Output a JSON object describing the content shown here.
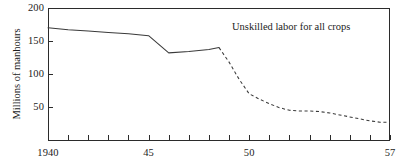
{
  "chart_data": {
    "type": "line",
    "title": "",
    "annotation": "Unskilled labor for all crops",
    "xlabel": "",
    "ylabel": "Millions of manhours",
    "xlim": [
      1940,
      1957
    ],
    "ylim": [
      0,
      200
    ],
    "grid": false,
    "legend_position": "none",
    "x_tick_labels": [
      "1940",
      "45",
      "50",
      "57"
    ],
    "x_tick_label_values": [
      1940,
      1945,
      1950,
      1957
    ],
    "x_tick_values": [
      1940,
      1941,
      1942,
      1943,
      1944,
      1945,
      1946,
      1947,
      1948,
      1949,
      1950,
      1951,
      1952,
      1953,
      1954,
      1955,
      1956,
      1957
    ],
    "y_tick_labels": [
      "200",
      "150",
      "100",
      "50"
    ],
    "y_tick_values": [
      200,
      150,
      100,
      50
    ],
    "series": [
      {
        "name": "Unskilled labor for all crops (observed)",
        "style": "solid",
        "x": [
          1940,
          1941,
          1942,
          1943,
          1944,
          1945,
          1946,
          1947,
          1948,
          1948.5
        ],
        "values": [
          170,
          167,
          165,
          163,
          161,
          158,
          132,
          134,
          137,
          140
        ]
      },
      {
        "name": "Unskilled labor for all crops (projected)",
        "style": "dashed",
        "x": [
          1948.5,
          1949,
          1949.5,
          1950,
          1950.5,
          1951,
          1951.5,
          1952,
          1952.5,
          1953,
          1953.5,
          1954,
          1954.5,
          1955,
          1955.5,
          1956,
          1956.5,
          1957
        ],
        "values": [
          140,
          118,
          92,
          70,
          62,
          55,
          49,
          45,
          44,
          44,
          43,
          41,
          38,
          35,
          32,
          29,
          27,
          27
        ]
      }
    ]
  },
  "axis": {
    "y_axis_title": "Millions of manhours"
  }
}
